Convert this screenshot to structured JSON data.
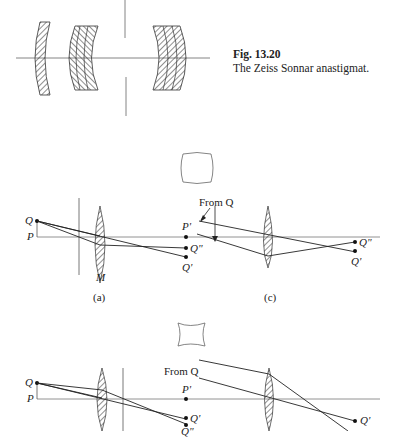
{
  "figure": {
    "number": "Fig. 13.20",
    "caption": "The Zeiss Sonnar anastigmat."
  },
  "diagram_a": {
    "label": "(a)",
    "stop_label": "M",
    "points": {
      "object_top": "Q",
      "object_base": "P",
      "image_q_double": "Q\"",
      "image_q_prime": "Q'"
    }
  },
  "diagram_c": {
    "label": "(c)",
    "annotation": "From Q",
    "points": {
      "p_prime": "P'",
      "image_q_double": "Q\"",
      "image_q_prime": "Q'"
    }
  },
  "diagram_b": {
    "points": {
      "object_top": "Q",
      "object_base": "P",
      "image_q_prime": "Q'",
      "image_q_double": "Q\""
    }
  },
  "diagram_d": {
    "annotation": "From Q",
    "points": {
      "p_prime": "P'",
      "image_q_prime": "Q'"
    }
  },
  "shapes": {
    "barrel": "barrel-distortion-square",
    "pincushion": "pincushion-distortion-square"
  }
}
